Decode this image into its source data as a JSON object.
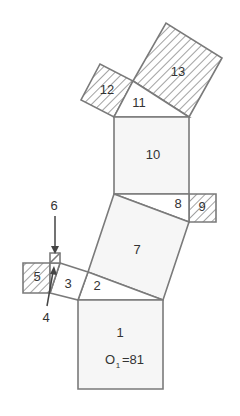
{
  "diagram": {
    "type": "pythagoras-tree-puzzle",
    "labels": {
      "s1": "1",
      "s1_area_prefix": "O",
      "s1_area_sub": "1",
      "s1_area_value": "=81",
      "t2": "2",
      "s3": "3",
      "t4": "4",
      "s5": "5",
      "s6": "6",
      "s7": "7",
      "t8": "8",
      "s9": "9",
      "s10": "10",
      "t11": "11",
      "s12": "12",
      "s13": "13"
    },
    "hatched_shapes": [
      "5",
      "9",
      "12",
      "13"
    ],
    "colors": {
      "stroke": "#7a7a7a",
      "fill_square": "#f6f6f6",
      "hatch": "#7a7a7a",
      "text": "#333333"
    }
  }
}
